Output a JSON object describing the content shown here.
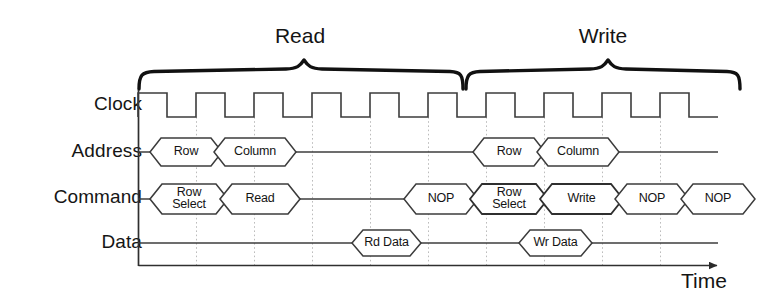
{
  "diagram": {
    "type": "timing-diagram",
    "title_braces": [
      {
        "label": "Read",
        "start_x": 138,
        "end_x": 462
      },
      {
        "label": "Write",
        "start_x": 466,
        "end_x": 740
      }
    ],
    "axis": {
      "time_label": "Time",
      "y_axis_x": 138,
      "x_axis_y": 265,
      "arrow": "right-arrow"
    },
    "signals": [
      {
        "name": "Clock",
        "label": "Clock"
      },
      {
        "name": "Address",
        "label": "Address"
      },
      {
        "name": "Command",
        "label": "Command"
      },
      {
        "name": "Data",
        "label": "Data"
      }
    ],
    "clock": {
      "cycles": 9,
      "start_x": 138,
      "period": 58,
      "high_first": true,
      "high_y": 93,
      "low_y": 117
    },
    "address_packets": [
      {
        "label": "Row",
        "x1": 150,
        "x2": 222,
        "y": 152
      },
      {
        "label": "Column",
        "x1": 214,
        "x2": 296,
        "y": 152
      },
      {
        "label": "Row",
        "x1": 473,
        "x2": 545,
        "y": 152
      },
      {
        "label": "Column",
        "x1": 537,
        "x2": 619,
        "y": 152
      }
    ],
    "command_packets": [
      {
        "label": "Row\nSelect",
        "lines": [
          "Row",
          "Select"
        ],
        "x1": 150,
        "x2": 228,
        "y": 199
      },
      {
        "label": "Read",
        "lines": [
          "Read"
        ],
        "x1": 220,
        "x2": 300,
        "y": 199
      },
      {
        "label": "NOP",
        "lines": [
          "NOP"
        ],
        "x1": 404,
        "x2": 478,
        "y": 199
      },
      {
        "label": "Row\nSelect",
        "lines": [
          "Row",
          "Select"
        ],
        "x1": 470,
        "x2": 548,
        "y": 199
      },
      {
        "label": "Write",
        "lines": [
          "Write"
        ],
        "x1": 540,
        "x2": 623,
        "y": 199
      },
      {
        "label": "NOP",
        "lines": [
          "NOP"
        ],
        "x1": 615,
        "x2": 689,
        "y": 199
      },
      {
        "label": "NOP",
        "lines": [
          "NOP"
        ],
        "x1": 681,
        "x2": 755,
        "y": 199
      }
    ],
    "data_packets": [
      {
        "label": "Rd Data",
        "x1": 352,
        "x2": 421,
        "y": 243
      },
      {
        "label": "Wr Data",
        "x1": 519,
        "x2": 592,
        "y": 243
      }
    ],
    "gridlines_x": [
      196,
      254,
      312,
      370,
      428,
      486,
      544,
      602,
      660
    ],
    "colors": {
      "ink": "#1a1a1a",
      "signal_line": "#3a3a3a",
      "grid": "#b9b9b9",
      "brace": "#111111",
      "background": "#ffffff"
    }
  }
}
